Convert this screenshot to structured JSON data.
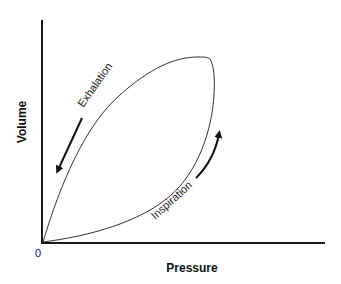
{
  "diagram": {
    "type": "pressure-volume loop",
    "x_axis": {
      "label": "Pressure"
    },
    "y_axis": {
      "label": "Volume"
    },
    "origin_label": "0",
    "curves": [
      {
        "name": "Exhalation",
        "label": "Exhalation",
        "direction": "down-left toward origin"
      },
      {
        "name": "Inspiration",
        "label": "Inspiration",
        "direction": "up-right away from origin"
      }
    ],
    "colors": {
      "line": "#333333",
      "axis": "#1a1a1a",
      "background": "#ffffff"
    }
  }
}
